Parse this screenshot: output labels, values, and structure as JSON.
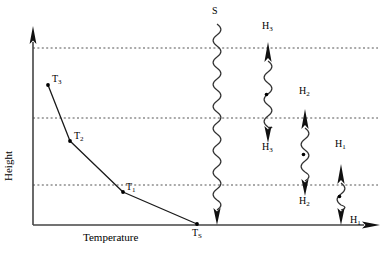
{
  "figure": {
    "type": "scientific-diagram",
    "background_color": "#ffffff",
    "line_color": "#000000",
    "dotted_color": "#555555"
  },
  "axes": {
    "y_label": "Height",
    "x_label": "Temperature",
    "y_axis": {
      "x": 33,
      "y_top": 28,
      "y_bottom": 225,
      "arrow": "up"
    },
    "x_axis": {
      "y": 225,
      "x_left": 33,
      "x_right": 378,
      "arrow": "right"
    }
  },
  "dotted_levels": [
    {
      "name": "level-top",
      "y": 48
    },
    {
      "name": "level-middle",
      "y": 118
    },
    {
      "name": "level-bottom",
      "y": 185
    }
  ],
  "curve": {
    "name": "temperature-height-profile",
    "points": [
      {
        "label": "T",
        "sub": "3",
        "x": 48,
        "y": 85,
        "label_x": 52,
        "label_y": 74
      },
      {
        "label": "T",
        "sub": "2",
        "x": 70,
        "y": 141,
        "label_x": 74,
        "label_y": 131
      },
      {
        "label": "T",
        "sub": "1",
        "x": 123,
        "y": 192,
        "label_x": 126,
        "label_y": 182
      },
      {
        "label": "T",
        "sub": "S",
        "x": 197,
        "y": 224,
        "label_x": 192,
        "label_y": 228
      }
    ]
  },
  "wave_columns": [
    {
      "name": "wave-s",
      "x": 217,
      "top": 24,
      "bottom": 225,
      "top_label": {
        "text": "S",
        "sub": "",
        "x": 212,
        "y": 6
      },
      "bottom_label": null,
      "top_arrow": null,
      "bottom_arrow": "down",
      "mid_dot": false
    },
    {
      "name": "wave-h3",
      "x": 268,
      "top": 42,
      "bottom": 143,
      "top_label": {
        "text": "H",
        "sub": "3",
        "x": 262,
        "y": 21
      },
      "bottom_label": {
        "text": "H",
        "sub": "3",
        "x": 262,
        "y": 142
      },
      "top_arrow": "up",
      "bottom_arrow": "down",
      "mid_dot": true
    },
    {
      "name": "wave-h2",
      "x": 305,
      "top": 109,
      "bottom": 196,
      "top_label": {
        "text": "H",
        "sub": "2",
        "x": 299,
        "y": 86
      },
      "bottom_label": {
        "text": "H",
        "sub": "2",
        "x": 299,
        "y": 196
      },
      "top_arrow": "up",
      "bottom_arrow": "down",
      "mid_dot": true
    },
    {
      "name": "wave-h1",
      "x": 341,
      "top": 164,
      "bottom": 225,
      "top_label": {
        "text": "H",
        "sub": "1",
        "x": 335,
        "y": 139
      },
      "bottom_label": {
        "text": "H",
        "sub": "1",
        "x": 350,
        "y": 215
      },
      "top_arrow": "up",
      "bottom_arrow": "down",
      "mid_dot": true
    }
  ]
}
